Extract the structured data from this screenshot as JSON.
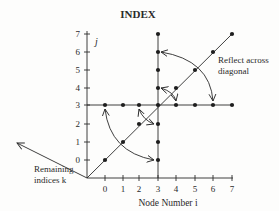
{
  "title": "INDEX",
  "y_axis": {
    "label": "j",
    "ticks": [
      "0",
      "1",
      "2",
      "3",
      "4",
      "5",
      "6",
      "7"
    ]
  },
  "x_axis": {
    "label": "Node Number i",
    "ticks": [
      "0",
      "1",
      "2",
      "3",
      "4",
      "5",
      "6",
      "7"
    ]
  },
  "annotations": {
    "reflect_line1": "Reflect across",
    "reflect_line2": "diagonal",
    "remaining_line1": "Remaining",
    "remaining_line2": "indices k"
  },
  "points": {
    "vertical_i3": [
      [
        3,
        0
      ],
      [
        3,
        1
      ],
      [
        3,
        2
      ],
      [
        3,
        4
      ],
      [
        3,
        5
      ],
      [
        3,
        6
      ],
      [
        3,
        7
      ]
    ],
    "horizontal_j3": [
      [
        0,
        3
      ],
      [
        1,
        3
      ],
      [
        2,
        3
      ],
      [
        3,
        3
      ],
      [
        4,
        3
      ],
      [
        5,
        3
      ],
      [
        6,
        3
      ],
      [
        7,
        3
      ]
    ],
    "diagonal": [
      [
        0,
        0
      ],
      [
        1,
        1
      ],
      [
        2,
        2
      ],
      [
        3,
        3
      ],
      [
        4,
        4
      ],
      [
        5,
        5
      ],
      [
        6,
        6
      ],
      [
        7,
        7
      ]
    ]
  },
  "arrows": [
    {
      "from": [
        0,
        3
      ],
      "to": [
        3,
        0
      ],
      "type": "double"
    },
    {
      "from": [
        2,
        3
      ],
      "to": [
        3,
        2
      ],
      "type": "double"
    },
    {
      "from": [
        3,
        4
      ],
      "to": [
        4,
        3
      ],
      "type": "double"
    },
    {
      "from": [
        3,
        6
      ],
      "to": [
        6,
        3
      ],
      "type": "double"
    }
  ],
  "colors": {
    "ink": "#2a2a2a",
    "background": "#fdfdfc"
  }
}
